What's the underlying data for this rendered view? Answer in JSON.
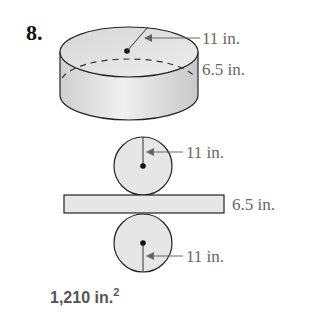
{
  "problem": {
    "number": "8.",
    "cylinder": {
      "radius_label": "11 in.",
      "height_label": "6.5 in."
    },
    "net": {
      "top_circle_label": "11 in.",
      "rectangle_label": "6.5 in.",
      "bottom_circle_label": "11 in."
    },
    "answer": {
      "value": "1,210 in.",
      "exponent": "2"
    }
  }
}
